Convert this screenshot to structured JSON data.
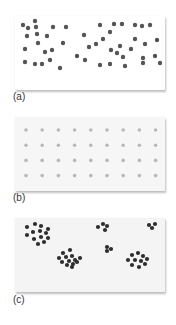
{
  "figure": {
    "panels": [
      {
        "id": "a",
        "label": "(a)",
        "pattern": "random",
        "dot_color": "#555555",
        "dot_radius": 2.2,
        "dots": [
          [
            20,
            5
          ],
          [
            8,
            9
          ],
          [
            13,
            12
          ],
          [
            21,
            11
          ],
          [
            38,
            11
          ],
          [
            51,
            11
          ],
          [
            12,
            20
          ],
          [
            22,
            18
          ],
          [
            32,
            20
          ],
          [
            48,
            27
          ],
          [
            23,
            27
          ],
          [
            30,
            36
          ],
          [
            37,
            34
          ],
          [
            10,
            33
          ],
          [
            35,
            44
          ],
          [
            10,
            46
          ],
          [
            20,
            48
          ],
          [
            27,
            48
          ],
          [
            45,
            52
          ],
          [
            69,
            19
          ],
          [
            85,
            9
          ],
          [
            81,
            28
          ],
          [
            88,
            23
          ],
          [
            99,
            8
          ],
          [
            95,
            16
          ],
          [
            107,
            8
          ],
          [
            120,
            9
          ],
          [
            127,
            10
          ],
          [
            135,
            9
          ],
          [
            105,
            30
          ],
          [
            120,
            23
          ],
          [
            130,
            28
          ],
          [
            142,
            24
          ],
          [
            108,
            41
          ],
          [
            128,
            42
          ],
          [
            140,
            40
          ],
          [
            95,
            48
          ],
          [
            110,
            50
          ],
          [
            128,
            47
          ],
          [
            145,
            47
          ],
          [
            70,
            44
          ],
          [
            85,
            49
          ],
          [
            62,
            40
          ],
          [
            102,
            37
          ],
          [
            116,
            33
          ],
          [
            74,
            31
          ],
          [
            96,
            34
          ]
        ]
      },
      {
        "id": "b",
        "label": "(b)",
        "pattern": "uniform",
        "dot_color": "#b8b8b8",
        "dot_radius": 1.8,
        "grid": {
          "rows": 4,
          "cols": 9,
          "x0": 11,
          "y0": 13,
          "dx": 16.2,
          "dy": 15.2
        }
      },
      {
        "id": "c",
        "label": "(c)",
        "pattern": "clustered",
        "dot_color": "#2e2e2e",
        "dot_radius": 2.1,
        "dots": [
          [
            12,
            9
          ],
          [
            20,
            6
          ],
          [
            26,
            8
          ],
          [
            33,
            11
          ],
          [
            18,
            14
          ],
          [
            25,
            13
          ],
          [
            31,
            15
          ],
          [
            12,
            17
          ],
          [
            19,
            21
          ],
          [
            26,
            19
          ],
          [
            33,
            20
          ],
          [
            23,
            26
          ],
          [
            29,
            24
          ],
          [
            83,
            9
          ],
          [
            88,
            6
          ],
          [
            92,
            8
          ],
          [
            90,
            12
          ],
          [
            134,
            7
          ],
          [
            140,
            6
          ],
          [
            137,
            10
          ],
          [
            92,
            29
          ],
          [
            96,
            31
          ],
          [
            92,
            33
          ],
          [
            48,
            35
          ],
          [
            55,
            32
          ],
          [
            44,
            40
          ],
          [
            51,
            39
          ],
          [
            57,
            38
          ],
          [
            47,
            44
          ],
          [
            54,
            43
          ],
          [
            60,
            42
          ],
          [
            65,
            40
          ],
          [
            52,
            47
          ],
          [
            58,
            46
          ],
          [
            62,
            44
          ],
          [
            57,
            49
          ],
          [
            117,
            37
          ],
          [
            123,
            35
          ],
          [
            128,
            38
          ],
          [
            113,
            42
          ],
          [
            120,
            42
          ],
          [
            126,
            43
          ],
          [
            132,
            41
          ],
          [
            117,
            47
          ],
          [
            124,
            49
          ],
          [
            130,
            46
          ]
        ]
      }
    ]
  }
}
